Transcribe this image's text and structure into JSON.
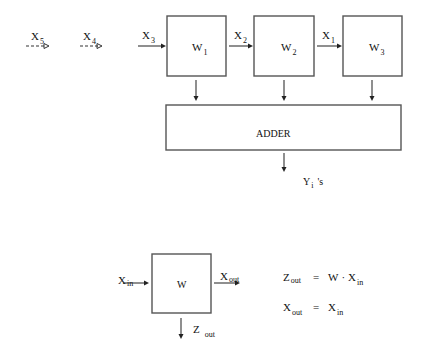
{
  "diagram": {
    "type": "systolic-array-block-diagram",
    "top": {
      "inputs": [
        {
          "id": "x5",
          "base": "X",
          "sub": "5",
          "style": "dashed"
        },
        {
          "id": "x4",
          "base": "X",
          "sub": "4",
          "style": "dashed"
        },
        {
          "id": "x3",
          "base": "X",
          "sub": "3",
          "style": "solid"
        },
        {
          "id": "x2",
          "base": "X",
          "sub": "2",
          "style": "solid"
        },
        {
          "id": "x1",
          "base": "X",
          "sub": "1",
          "style": "solid"
        }
      ],
      "cells": [
        {
          "id": "w1",
          "base": "W",
          "sub": "1"
        },
        {
          "id": "w2",
          "base": "W",
          "sub": "2"
        },
        {
          "id": "w3",
          "base": "W",
          "sub": "3"
        }
      ],
      "adder": {
        "label": "ADDER"
      },
      "output": {
        "base": "Y",
        "sub": "i",
        "suffix": "'s"
      }
    },
    "cell_detail": {
      "cell_label": "W",
      "input": {
        "base": "X",
        "sub": "in"
      },
      "output_right": {
        "base": "X",
        "sub": "out"
      },
      "output_down": {
        "base": "Z",
        "sub": "out"
      }
    },
    "equations": [
      {
        "lhs_base": "Z",
        "lhs_sub": "out",
        "eq": "=",
        "rhs_a": "W",
        "op": "·",
        "rhs_base": "X",
        "rhs_sub": "in"
      },
      {
        "lhs_base": "X",
        "lhs_sub": "out",
        "eq": "=",
        "rhs_base": "X",
        "rhs_sub": "in"
      }
    ]
  },
  "colors": {
    "stroke": "#555555",
    "text": "#111111",
    "background": "#ffffff"
  }
}
